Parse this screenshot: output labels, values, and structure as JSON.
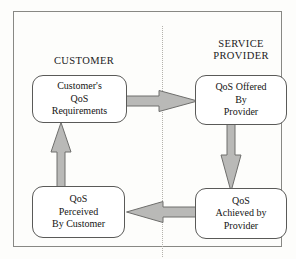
{
  "diagram": {
    "background_color": "#fdfdfb",
    "border_color": "#888884",
    "arrow_fill": "#b9b9b7",
    "arrow_stroke": "#6e6e6c",
    "node_border": "#5a5a58",
    "divider_style": "dotted vertical line"
  },
  "domains": [
    {
      "id": "customer",
      "label": "CUSTOMER"
    },
    {
      "id": "provider",
      "label": "SERVICE\nPROVIDER"
    }
  ],
  "nodes": [
    {
      "id": "requirements",
      "label": "Customer's\nQoS\nRequirements",
      "domain": "customer"
    },
    {
      "id": "offered",
      "label": "QoS Offered\nBy\nProvider",
      "domain": "provider"
    },
    {
      "id": "achieved",
      "label": "QoS\nAchieved by\nProvider",
      "domain": "provider"
    },
    {
      "id": "perceived",
      "label": "QoS\nPerceived\nBy Customer",
      "domain": "customer"
    }
  ],
  "arrows": [
    {
      "id": "requirements-to-offered",
      "from": "requirements",
      "to": "offered",
      "direction": "right"
    },
    {
      "id": "offered-to-achieved",
      "from": "offered",
      "to": "achieved",
      "direction": "down"
    },
    {
      "id": "achieved-to-perceived",
      "from": "achieved",
      "to": "perceived",
      "direction": "left"
    },
    {
      "id": "perceived-to-requirements",
      "from": "perceived",
      "to": "requirements",
      "direction": "up"
    }
  ]
}
